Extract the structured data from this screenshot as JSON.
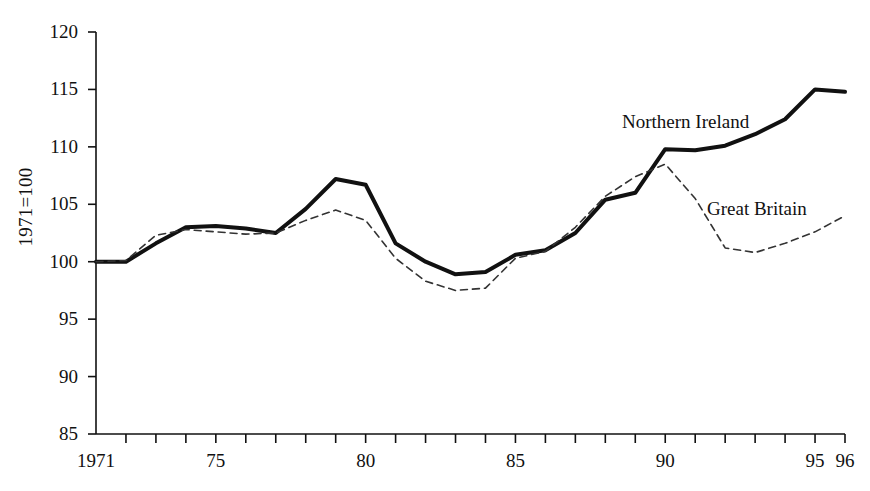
{
  "chart_data": {
    "type": "line",
    "title": "",
    "xlabel": "",
    "ylabel": "1971=100",
    "xlim": [
      1971,
      1996
    ],
    "ylim": [
      85,
      120
    ],
    "grid": false,
    "legend_position": "inline-annotations",
    "y_ticks": [
      120,
      115,
      110,
      105,
      100,
      95,
      90,
      85
    ],
    "y_tick_labels": [
      "120",
      "115",
      "110",
      "105",
      "100",
      "95",
      "90",
      "85"
    ],
    "x_ticks": [
      1971,
      1972,
      1973,
      1974,
      1975,
      1976,
      1977,
      1978,
      1979,
      1980,
      1981,
      1982,
      1983,
      1984,
      1985,
      1986,
      1987,
      1988,
      1989,
      1990,
      1991,
      1992,
      1993,
      1994,
      1995,
      1996
    ],
    "x_tick_labels": [
      {
        "value": 1971,
        "label": "1971"
      },
      {
        "value": 1975,
        "label": "75"
      },
      {
        "value": 1980,
        "label": "80"
      },
      {
        "value": 1985,
        "label": "85"
      },
      {
        "value": 1990,
        "label": "90"
      },
      {
        "value": 1995,
        "label": "95"
      },
      {
        "value": 1996,
        "label": "96"
      }
    ],
    "x": [
      1971,
      1972,
      1973,
      1974,
      1975,
      1976,
      1977,
      1978,
      1979,
      1980,
      1981,
      1982,
      1983,
      1984,
      1985,
      1986,
      1987,
      1988,
      1989,
      1990,
      1991,
      1992,
      1993,
      1994,
      1995,
      1996
    ],
    "series": [
      {
        "name": "Northern Ireland",
        "style": "solid",
        "color": "#111111",
        "width": 4,
        "values": [
          100.0,
          100.0,
          101.6,
          103.0,
          103.1,
          102.9,
          102.5,
          104.6,
          107.2,
          106.7,
          101.6,
          100.0,
          98.9,
          99.1,
          100.6,
          101.0,
          102.5,
          105.4,
          106.0,
          109.8,
          109.7,
          110.1,
          111.1,
          112.4,
          115.0,
          114.8
        ]
      },
      {
        "name": "Great Britain",
        "style": "dashed",
        "color": "#333333",
        "width": 1.6,
        "values": [
          100.0,
          100.1,
          102.3,
          102.8,
          102.6,
          102.4,
          102.5,
          103.6,
          104.5,
          103.6,
          100.3,
          98.3,
          97.5,
          97.7,
          100.3,
          100.9,
          103.0,
          105.7,
          107.4,
          108.5,
          105.5,
          101.2,
          100.8,
          101.6,
          102.6,
          104.0
        ]
      }
    ],
    "annotations": [
      {
        "text": "Northern Ireland",
        "x_px": 622,
        "y_px": 112
      },
      {
        "text": "Great Britain",
        "x_px": 707,
        "y_px": 199
      }
    ]
  },
  "geometry": {
    "plot_left": 96,
    "plot_right": 845,
    "plot_top": 32,
    "plot_bottom": 434
  }
}
